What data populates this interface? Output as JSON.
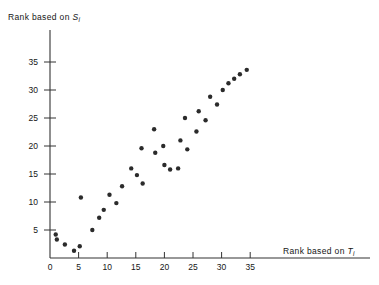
{
  "chart_data": {
    "type": "scatter",
    "title": "",
    "subtitle": "",
    "xlabel": "Rank based on T",
    "xlabel_subscript": "i",
    "ylabel": "Rank based on S",
    "ylabel_subscript": "i",
    "xlim": [
      0,
      38
    ],
    "ylim": [
      0,
      38
    ],
    "xticks": [
      0,
      5,
      10,
      15,
      20,
      25,
      30,
      35
    ],
    "yticks": [
      5,
      10,
      15,
      20,
      25,
      30,
      35
    ],
    "grid": false,
    "legend": null,
    "marker": {
      "shape": "circle",
      "color": "#2b2b2b",
      "size_px": 4.4
    },
    "series": [
      {
        "name": "rank pairs",
        "points": [
          [
            1,
            4.2
          ],
          [
            1.2,
            3.3
          ],
          [
            2.6,
            2.4
          ],
          [
            4.2,
            1.3
          ],
          [
            5.2,
            2.1
          ],
          [
            5.4,
            10.8
          ],
          [
            7.4,
            5.0
          ],
          [
            8.6,
            7.2
          ],
          [
            9.4,
            8.6
          ],
          [
            10.4,
            11.3
          ],
          [
            11.6,
            9.8
          ],
          [
            12.6,
            12.8
          ],
          [
            14.2,
            16.0
          ],
          [
            15.2,
            14.8
          ],
          [
            16.2,
            13.3
          ],
          [
            16.0,
            19.6
          ],
          [
            18.2,
            23.0
          ],
          [
            18.4,
            18.8
          ],
          [
            19.8,
            20.0
          ],
          [
            20.0,
            16.6
          ],
          [
            21.0,
            15.8
          ],
          [
            22.4,
            16.0
          ],
          [
            22.8,
            21.0
          ],
          [
            23.6,
            25.0
          ],
          [
            24.0,
            19.4
          ],
          [
            25.6,
            22.6
          ],
          [
            26.0,
            26.2
          ],
          [
            27.2,
            24.6
          ],
          [
            28.0,
            28.8
          ],
          [
            29.2,
            27.4
          ],
          [
            30.2,
            30.0
          ],
          [
            31.2,
            31.2
          ],
          [
            32.2,
            32.0
          ],
          [
            33.2,
            32.8
          ],
          [
            34.4,
            33.6
          ]
        ]
      }
    ]
  },
  "axis": {
    "x_label_prefix": "Rank based on ",
    "x_label_var": "T",
    "x_label_sub": "i",
    "y_label_prefix": "Rank based on ",
    "y_label_var": "S",
    "y_label_sub": "i"
  }
}
